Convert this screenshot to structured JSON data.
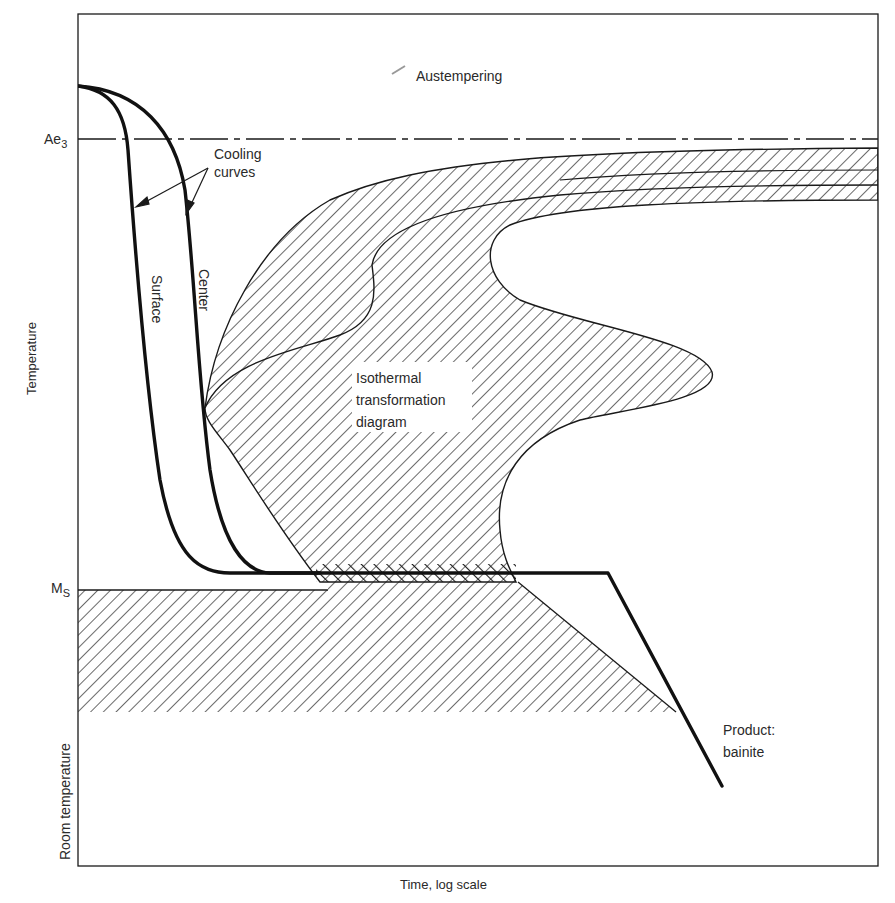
{
  "figure": {
    "title": "Austempering",
    "x_axis_label": "Time, log scale",
    "y_axis_label": "Temperature",
    "y_markers": {
      "ae3": {
        "base": "Ae",
        "sub": "3"
      },
      "ms": {
        "base": "M",
        "sub": "S"
      },
      "room": "Room temperature"
    },
    "annotations": {
      "cooling_curves": [
        "Cooling",
        "curves"
      ],
      "surface": "Surface",
      "center": "Center",
      "ttt_diagram": [
        "Isothermal",
        "transformation",
        "diagram"
      ],
      "product": [
        "Product:",
        "bainite"
      ]
    },
    "colors": {
      "ink": "#1a1a1a",
      "text": "#2a2a2a",
      "background": "#ffffff"
    }
  }
}
